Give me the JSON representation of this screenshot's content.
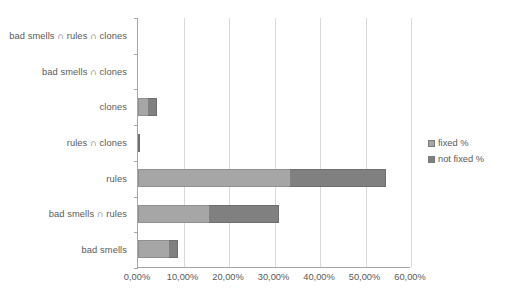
{
  "chart_data": {
    "type": "bar",
    "orientation": "horizontal",
    "stacked": true,
    "title": "",
    "xlabel": "",
    "ylabel": "",
    "xlim": [
      0,
      60
    ],
    "xtick_labels": [
      "0,00%",
      "10,00%",
      "20,00%",
      "30,00%",
      "40,00%",
      "50,00%",
      "60,00%"
    ],
    "xtick_values": [
      0,
      10,
      20,
      30,
      40,
      50,
      60
    ],
    "grid": "vertical",
    "legend_position": "right",
    "categories": [
      "bad smells ∩ rules ∩ clones",
      "bad smells ∩ clones",
      "clones",
      "rules ∩ clones",
      "rules",
      "bad smells ∩ rules",
      "bad smells"
    ],
    "series": [
      {
        "name": "fixed %",
        "color": "#a6a6a6",
        "values": [
          0,
          0,
          2.2,
          0.4,
          33.3,
          15.5,
          6.9
        ]
      },
      {
        "name": "not fixed %",
        "color": "#808080",
        "values": [
          0,
          0,
          2.0,
          0.0,
          21.2,
          15.5,
          2.0
        ]
      }
    ],
    "totals": [
      0,
      0,
      4.2,
      0.4,
      54.5,
      31.0,
      8.9
    ]
  },
  "legend": {
    "items": [
      {
        "label": "fixed %",
        "color": "#a6a6a6"
      },
      {
        "label": "not fixed %",
        "color": "#808080"
      }
    ]
  }
}
